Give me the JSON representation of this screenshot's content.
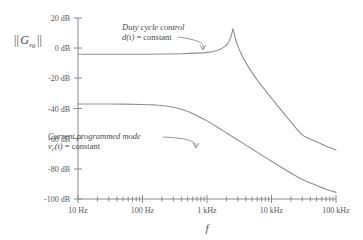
{
  "chart_data": {
    "type": "line",
    "title": "",
    "subtitle": "",
    "xlabel": "f",
    "ylabel": "|| G_vg ||",
    "xscale": "log",
    "xlim": [
      10,
      100000
    ],
    "ylim": [
      -100,
      20
    ],
    "yunit": "dB",
    "grid": false,
    "legend_position": "inline-annotations",
    "x_tick_labels": [
      "10 Hz",
      "100 Hz",
      "1 kHz",
      "10 kHz",
      "100 kHz"
    ],
    "x_tick_values": [
      10,
      100,
      1000,
      10000,
      100000
    ],
    "y_tick_labels": [
      "20 dB",
      "0 dB",
      "-20 dB",
      "-40 dB",
      "-60 dB",
      "-80 dB",
      "-100 dB"
    ],
    "y_tick_values": [
      20,
      0,
      -20,
      -40,
      -60,
      -80,
      -100
    ],
    "series": [
      {
        "name": "Duty cycle control",
        "condition": "d(t) = constant",
        "color": "#8f8f8f",
        "points": [
          [
            10,
            -4.0
          ],
          [
            20,
            -4.0
          ],
          [
            50,
            -4.0
          ],
          [
            100,
            -4.0
          ],
          [
            200,
            -3.9
          ],
          [
            400,
            -3.7
          ],
          [
            700,
            -3.3
          ],
          [
            1000,
            -2.8
          ],
          [
            1300,
            -2.0
          ],
          [
            1600,
            -0.8
          ],
          [
            1900,
            1.2
          ],
          [
            2100,
            3.2
          ],
          [
            2300,
            6.5
          ],
          [
            2450,
            10.5
          ],
          [
            2520,
            12.8
          ],
          [
            2600,
            10.8
          ],
          [
            2750,
            6.5
          ],
          [
            3000,
            1.5
          ],
          [
            3500,
            -5.0
          ],
          [
            4000,
            -9.6
          ],
          [
            5000,
            -16.2
          ],
          [
            6000,
            -21.0
          ],
          [
            8000,
            -28.0
          ],
          [
            10000,
            -33.2
          ],
          [
            15000,
            -42.4
          ],
          [
            20000,
            -48.8
          ],
          [
            30000,
            -57.5
          ],
          [
            50000,
            -62.0
          ],
          [
            70000,
            -65.0
          ],
          [
            100000,
            -67.5
          ]
        ]
      },
      {
        "name": "Current programmed mode",
        "condition": "v_c(t) = constant",
        "color": "#8f8f8f",
        "points": [
          [
            10,
            -37.0
          ],
          [
            20,
            -37.0
          ],
          [
            50,
            -37.1
          ],
          [
            100,
            -37.3
          ],
          [
            150,
            -37.6
          ],
          [
            200,
            -38.0
          ],
          [
            300,
            -39.2
          ],
          [
            400,
            -40.5
          ],
          [
            600,
            -43.3
          ],
          [
            800,
            -46.0
          ],
          [
            1000,
            -48.2
          ],
          [
            1500,
            -52.8
          ],
          [
            2000,
            -56.2
          ],
          [
            3000,
            -60.9
          ],
          [
            5000,
            -66.8
          ],
          [
            7000,
            -70.8
          ],
          [
            10000,
            -75.0
          ],
          [
            15000,
            -79.6
          ],
          [
            20000,
            -82.8
          ],
          [
            30000,
            -87.0
          ],
          [
            50000,
            -91.0
          ],
          [
            70000,
            -93.5
          ],
          [
            100000,
            -95.6
          ]
        ]
      }
    ],
    "annotations": [
      {
        "id": "duty-cycle-annotation",
        "line1": "Duty cycle control",
        "line2_prefix": "d(t)",
        "line2_suffix": " = constant",
        "target_x": 1500,
        "target_y": -3.0
      },
      {
        "id": "current-mode-annotation",
        "line1": "Current programmed mode",
        "line2_prefix": "v",
        "line2_sub": "c",
        "line2_mid": "(t)",
        "line2_suffix": " = constant",
        "target_x": 1200,
        "target_y": -51.0
      }
    ],
    "ylabel_parts": {
      "bars_left": "||",
      "symbol": "G",
      "subscript": "vg",
      "bars_right": "||"
    }
  }
}
